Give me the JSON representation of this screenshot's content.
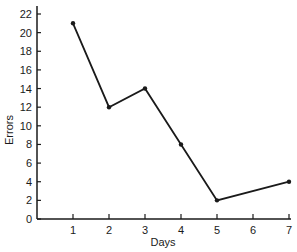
{
  "chart_data": {
    "type": "line",
    "title": "",
    "xlabel": "Days",
    "ylabel": "Errors",
    "x_ticks": [
      1,
      2,
      3,
      4,
      5,
      6,
      7
    ],
    "y_ticks": [
      0,
      2,
      4,
      6,
      8,
      10,
      12,
      14,
      16,
      18,
      20,
      22
    ],
    "xlim": [
      0,
      7
    ],
    "ylim": [
      0,
      22
    ],
    "grid": false,
    "legend": "none",
    "series": [
      {
        "name": "Errors",
        "x": [
          1,
          2,
          3,
          4,
          5,
          7
        ],
        "y": [
          21,
          12,
          14,
          8,
          2,
          4
        ],
        "color": "#1a1a1a"
      }
    ]
  }
}
